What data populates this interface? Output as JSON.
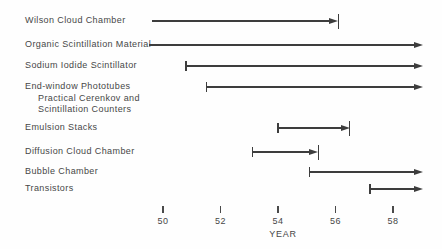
{
  "chart_data": {
    "type": "timeline",
    "xlabel": "YEAR",
    "x_ticks": [
      "50",
      "52",
      "54",
      "56",
      "58"
    ],
    "x_tick_values": [
      50,
      52,
      54,
      56,
      58
    ],
    "line_color": "#3d3d3d",
    "text_color": "#474747",
    "legend": "rows are horizontal arrows; left bar = start cap, right bar = end cap, arrow past axis = continuing",
    "rows": [
      {
        "id": "wilson-cloud-chamber",
        "label_lines": [
          "Wilson Cloud Chamber"
        ],
        "start_year": 49.6,
        "end_year": 56.1,
        "start_cap": "none",
        "end_cap": "bar",
        "continues": false,
        "y": 21
      },
      {
        "id": "organic-scintillation-material",
        "label_lines": [
          "Organic Scintillation Material"
        ],
        "start_year": 49.5,
        "end_year": null,
        "start_cap": "none",
        "end_cap": "none",
        "continues": true,
        "y": 45
      },
      {
        "id": "sodium-iodide-scintillator",
        "label_lines": [
          "Sodium Iodide Scintillator"
        ],
        "start_year": 50.8,
        "end_year": null,
        "start_cap": "bar",
        "end_cap": "none",
        "continues": true,
        "y": 66
      },
      {
        "id": "end-window-phototubes",
        "label_lines": [
          "End-window Phototubes",
          "Practical Cerenkov and",
          "Scintillation Counters"
        ],
        "start_year": 51.5,
        "end_year": null,
        "start_cap": "bar",
        "end_cap": "none",
        "continues": true,
        "y": 87
      },
      {
        "id": "emulsion-stacks",
        "label_lines": [
          "Emulsion Stacks"
        ],
        "start_year": 54.0,
        "end_year": 56.5,
        "start_cap": "bar",
        "end_cap": "bar",
        "continues": false,
        "y": 128
      },
      {
        "id": "diffusion-cloud-chamber",
        "label_lines": [
          "Diffusion Cloud Chamber"
        ],
        "start_year": 53.1,
        "end_year": 55.4,
        "start_cap": "bar",
        "end_cap": "bar",
        "continues": false,
        "y": 152
      },
      {
        "id": "bubble-chamber",
        "label_lines": [
          "Bubble Chamber"
        ],
        "start_year": 55.1,
        "end_year": null,
        "start_cap": "bar",
        "end_cap": "none",
        "continues": true,
        "y": 172
      },
      {
        "id": "transistors",
        "label_lines": [
          "Transistors"
        ],
        "start_year": 57.2,
        "end_year": null,
        "start_cap": "bar",
        "end_cap": "none",
        "continues": true,
        "y": 189
      }
    ]
  }
}
